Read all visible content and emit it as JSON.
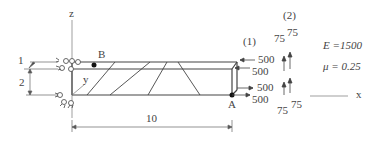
{
  "diagram": {
    "axes": {
      "z": "z",
      "y": "y",
      "x": "x"
    },
    "points": {
      "B": "B",
      "A": "A"
    },
    "dimensions": {
      "thickness": "1",
      "height": "2",
      "length": "10"
    },
    "load_cases": {
      "case1": "(1)",
      "case2": "(2)"
    },
    "loads_case1": [
      "500",
      "500",
      "500",
      "500"
    ],
    "loads_case2": [
      "75",
      "75",
      "75",
      "75"
    ],
    "material": {
      "E": "E =1500",
      "mu": "μ = 0.25"
    },
    "colors": {
      "line": "#444444",
      "dim": "#666666",
      "background": "#ffffff"
    }
  }
}
